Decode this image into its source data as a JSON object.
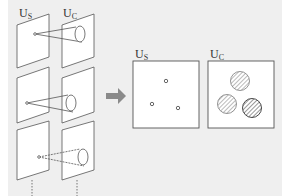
{
  "left_stack": {
    "label_s": {
      "main": "U",
      "sub": "S"
    },
    "label_c": {
      "main": "U",
      "sub": "C"
    }
  },
  "right_panels": {
    "label_s": {
      "main": "U",
      "sub": "S"
    },
    "label_c": {
      "main": "U",
      "sub": "C"
    }
  },
  "colors": {
    "background": "#efefef",
    "line": "#555555",
    "arrow": "#8a8a8a"
  }
}
